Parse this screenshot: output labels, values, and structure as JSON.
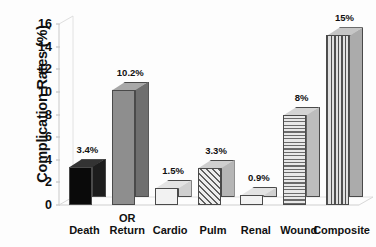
{
  "chart_data": {
    "type": "bar",
    "title": "",
    "xlabel": "",
    "ylabel": "Complication Rates (%)",
    "ylim": [
      0,
      16
    ],
    "ytick_step": 2,
    "ytick_labels": [
      "0",
      "2",
      "4",
      "6",
      "8",
      "10",
      "12",
      "14",
      "16"
    ],
    "grid": false,
    "legend": "none",
    "categories": [
      "Death",
      "OR Return",
      "Cardio",
      "Pulm",
      "Renal",
      "Wound",
      "Composite"
    ],
    "values": [
      3.4,
      10.2,
      1.5,
      3.3,
      0.9,
      8,
      15
    ],
    "data_labels": [
      "3.4%",
      "10.2%",
      "1.5%",
      "3.3%",
      "0.9%",
      "8%",
      "15%"
    ],
    "bar_styles": [
      "solid-black",
      "solid-gray",
      "white",
      "diagonal",
      "white",
      "horizontal",
      "vertical"
    ],
    "category_label_lines": [
      [
        "Death"
      ],
      [
        "OR",
        "Return"
      ],
      [
        "Cardio"
      ],
      [
        "Pulm"
      ],
      [
        "Renal"
      ],
      [
        "Wound"
      ],
      [
        "Composite"
      ]
    ]
  },
  "colors": {
    "background": "#fdfdfd",
    "text": "#101010",
    "axis": "#cccccc",
    "bar_black": "#0a0a0a",
    "bar_gray": "#8e8e8e",
    "bar_white": "#f2f2f2",
    "bar_outline": "#4a4a4a"
  }
}
